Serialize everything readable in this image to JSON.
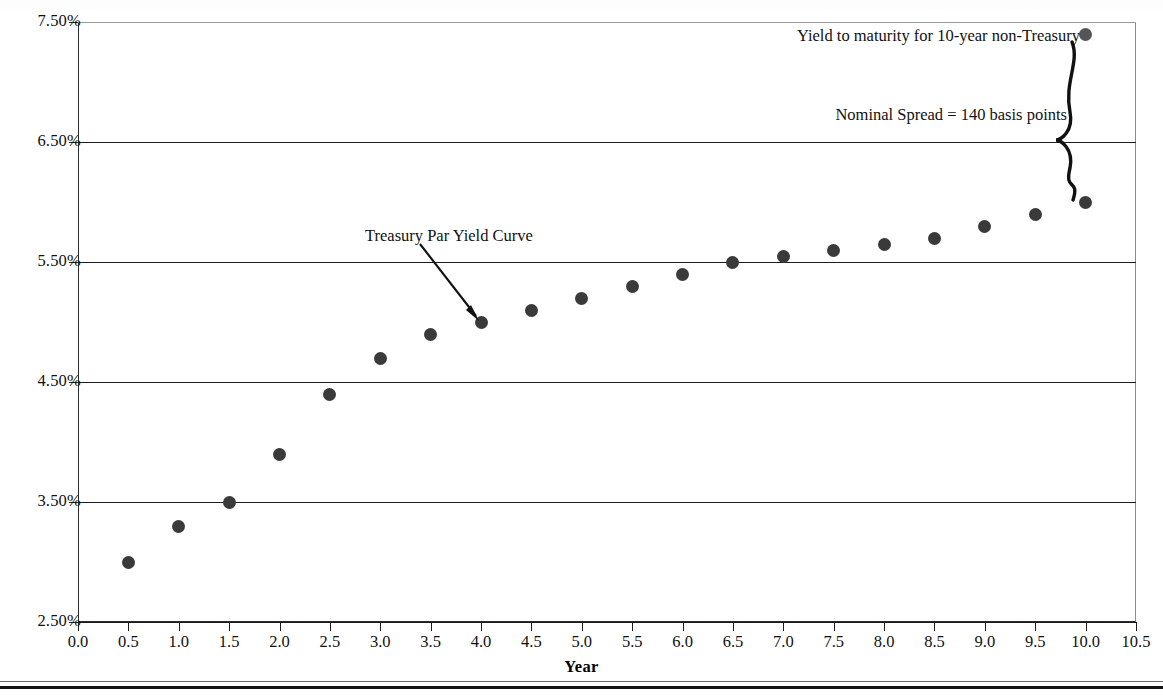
{
  "chart_data": {
    "type": "scatter",
    "title": "",
    "xlabel": "Year",
    "ylabel": "",
    "xlim": [
      0.0,
      10.5
    ],
    "ylim": [
      2.5,
      7.5
    ],
    "grid": true,
    "legend_position": "none",
    "x_ticks": [
      "0.0",
      "0.5",
      "1.0",
      "1.5",
      "2.0",
      "2.5",
      "3.0",
      "3.5",
      "4.0",
      "4.5",
      "5.0",
      "5.5",
      "6.0",
      "6.5",
      "7.0",
      "7.5",
      "8.0",
      "8.5",
      "9.0",
      "9.5",
      "10.0",
      "10.5"
    ],
    "y_ticks": [
      "2.50%",
      "3.50%",
      "4.50%",
      "5.50%",
      "6.50%",
      "7.50%"
    ],
    "series": [
      {
        "name": "Treasury Par Yield Curve",
        "x": [
          0.5,
          1.0,
          1.5,
          2.0,
          2.5,
          3.0,
          3.5,
          4.0,
          4.5,
          5.0,
          5.5,
          6.0,
          6.5,
          7.0,
          7.5,
          8.0,
          8.5,
          9.0,
          9.5,
          10.0
        ],
        "values": [
          3.0,
          3.3,
          3.5,
          3.9,
          4.4,
          4.7,
          4.9,
          5.0,
          5.1,
          5.2,
          5.3,
          5.4,
          5.5,
          5.55,
          5.6,
          5.65,
          5.7,
          5.8,
          5.9,
          6.0
        ]
      },
      {
        "name": "Yield to maturity for 10-year non-Treasury",
        "x": [
          10.0
        ],
        "values": [
          7.4
        ]
      }
    ],
    "annotations": [
      {
        "id": "curve-label",
        "text": "Treasury Par Yield Curve"
      },
      {
        "id": "ytm-label",
        "text": "Yield to maturity for 10-year non-Treasury"
      },
      {
        "id": "spread-label",
        "text": "Nominal Spread = 140 basis points"
      }
    ],
    "colors": {
      "marker": "#3a3a3a",
      "marker_highlight": "#555555",
      "axis": "#1c1c1c",
      "background": "#ffffff"
    }
  }
}
